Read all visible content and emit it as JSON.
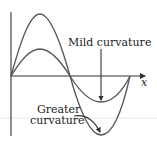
{
  "diagram": {
    "axis": {
      "x_label": "x"
    },
    "labels": {
      "mild": "Mild curvature",
      "greater_line1": "Greater",
      "greater_line2": "curvature"
    },
    "curves": [
      {
        "name": "large-amplitude-wave",
        "amplitude": "large",
        "curvature": "greater"
      },
      {
        "name": "small-amplitude-wave",
        "amplitude": "small",
        "curvature": "mild"
      }
    ],
    "colors": {
      "curve": "#555555",
      "axis": "#333333",
      "text": "#222222"
    }
  }
}
